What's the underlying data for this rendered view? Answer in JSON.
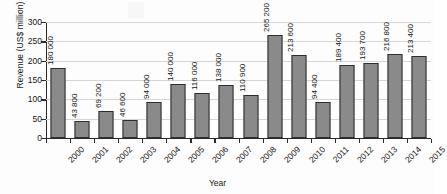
{
  "chart_data": {
    "type": "bar",
    "title": "",
    "subtitle": "",
    "xlabel": "Year",
    "ylabel": "Revenue (US$ million)",
    "categories": [
      "2000",
      "2001",
      "2002",
      "2003",
      "2004",
      "2005",
      "2006",
      "2007",
      "2008",
      "2009",
      "2010",
      "2011",
      "2012",
      "2013",
      "2014",
      "2015"
    ],
    "values": [
      180000,
      43800,
      69200,
      46600,
      94000,
      140000,
      116000,
      138000,
      110900,
      265200,
      213600,
      94400,
      189400,
      193700,
      216800,
      213400
    ],
    "value_labels": [
      "180 000",
      "43 800",
      "69 200",
      "46 600",
      "94 000",
      "140 000",
      "116 000",
      "138 000",
      "110 900",
      "265 200",
      "213 600",
      "94 400",
      "189 400",
      "193 700",
      "216 800",
      "213 400"
    ],
    "value_unit_scale": 1000,
    "ylim": [
      0,
      300
    ],
    "ytick_labels": [
      "0",
      "50",
      "100",
      "150",
      "200",
      "250",
      "300"
    ],
    "ytick_values": [
      0,
      50,
      100,
      150,
      200,
      250,
      300
    ],
    "grid": true,
    "grid_axis": "y",
    "legend": false,
    "legend_position": "none",
    "bar_color": "#8a8a8a",
    "bar_border_color": "#2e2e2e",
    "gridline_color": "#d5d5d5",
    "axis_color": "#2a2a2a",
    "background_color": "#fdfdfd",
    "xtick_label_rotation": -45,
    "value_label_rotation": -90
  }
}
